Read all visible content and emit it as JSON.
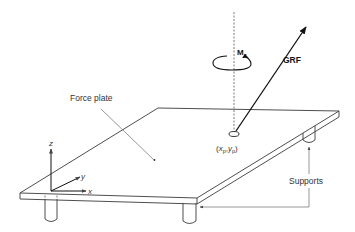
{
  "diagram": {
    "type": "force-plate-schematic",
    "labels": {
      "force_plate": "Force plate",
      "grf": "GRF",
      "moment_main": "M",
      "moment_sub": "z",
      "cop_open": "(",
      "cop_x": "x",
      "cop_x_sub": "p",
      "cop_sep": ",",
      "cop_y": "y",
      "cop_y_sub": "p",
      "cop_close": ")",
      "supports": "Supports",
      "axis_x": "x",
      "axis_y": "y",
      "axis_z": "z"
    },
    "colors": {
      "line": "#3a3a3a",
      "leader": "#6a6a6a",
      "arrow": "#111111",
      "background": "#ffffff"
    },
    "elements": [
      "force-plate",
      "ground-reaction-force-vector",
      "free-moment-Mz",
      "center-of-pressure",
      "coordinate-axes",
      "four-supports"
    ]
  }
}
